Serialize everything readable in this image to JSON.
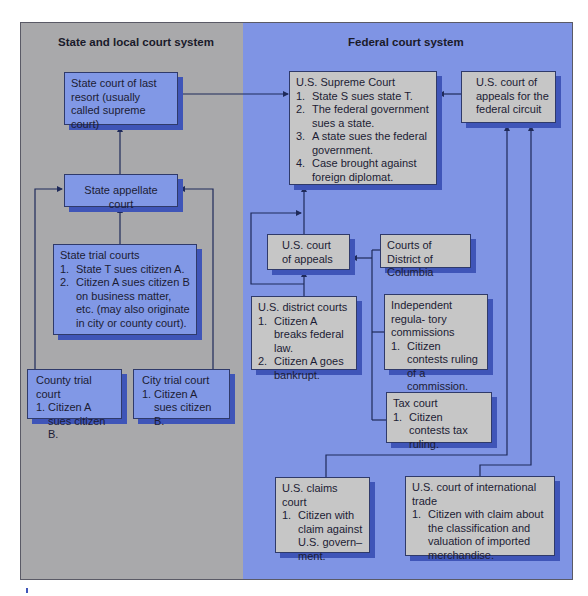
{
  "panels": {
    "state": {
      "title": "State and local court system",
      "bg_color": "#a9a9ab"
    },
    "federal": {
      "title": "Federal court system",
      "bg_color": "#7f94e4"
    }
  },
  "colors": {
    "state_box": "#8198e6",
    "federal_box": "#c6c6c6",
    "box_shadow": "#3f55b8",
    "line": "#1f2a5a"
  },
  "state_courts": {
    "supreme": {
      "title": "State  court of last resort (usually called supreme court)"
    },
    "appellate": {
      "title": "State appellate court"
    },
    "trial": {
      "title": "State trial courts",
      "items": [
        {
          "num": "1.",
          "text": "State T sues citizen A."
        },
        {
          "num": "2.",
          "text": "Citizen A sues citizen B on business matter, etc. (may also originate in city or county court)."
        }
      ]
    },
    "county": {
      "title": "County trial court",
      "items": [
        {
          "num": "1.",
          "text": "Citizen A sues citizen B."
        }
      ]
    },
    "city": {
      "title": "City trial court",
      "items": [
        {
          "num": "1.",
          "text": "Citizen A sues citizen B."
        }
      ]
    }
  },
  "federal_courts": {
    "supreme": {
      "title": "U.S. Supreme Court",
      "items": [
        {
          "num": "1.",
          "text": "State S sues state T."
        },
        {
          "num": "2.",
          "text": "The federal government sues a state."
        },
        {
          "num": "3.",
          "text": "A state sues the federal government."
        },
        {
          "num": "4.",
          "text": "Case brought against foreign diplomat."
        }
      ]
    },
    "federal_circuit": {
      "title": "U.S. court of appeals for the federal circuit"
    },
    "appeals": {
      "title": "U.S. court of appeals"
    },
    "dc": {
      "title": "Courts of District of Columbia"
    },
    "district": {
      "title": "U.S. district courts",
      "items": [
        {
          "num": "1.",
          "text": "Citizen A breaks federal law."
        },
        {
          "num": "2.",
          "text": "Citizen A goes bankrupt."
        }
      ]
    },
    "regulatory": {
      "title": "Independent regula- tory commissions",
      "items": [
        {
          "num": "1.",
          "text": "Citizen contests ruling of a commission."
        }
      ]
    },
    "tax": {
      "title": "Tax court",
      "items": [
        {
          "num": "1.",
          "text": "Citizen contests tax ruling."
        }
      ]
    },
    "claims": {
      "title": "U.S. claims court",
      "items": [
        {
          "num": "1.",
          "text": "Citizen with claim against U.S. govern– ment."
        }
      ]
    },
    "intl_trade": {
      "title": "U.S. court of international trade",
      "items": [
        {
          "num": "1.",
          "text": "Citizen with claim about the classification and valuation of imported merchandise."
        }
      ]
    }
  }
}
